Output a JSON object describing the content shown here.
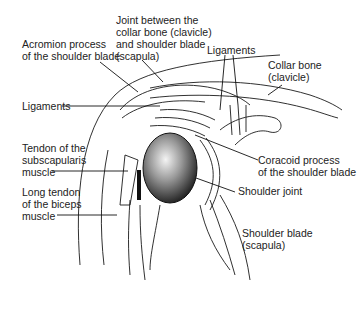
{
  "diagram": {
    "labels": [
      {
        "id": "acromion",
        "lines": [
          "Acromion process",
          "of the shoulder blade"
        ]
      },
      {
        "id": "ac-joint",
        "lines": [
          "Joint between the",
          "collar bone (clavicle)",
          "and shoulder blade",
          "(scapula)"
        ]
      },
      {
        "id": "ligaments-top",
        "lines": [
          "Ligaments"
        ]
      },
      {
        "id": "collar-bone",
        "lines": [
          "Collar bone",
          "(clavicle)"
        ]
      },
      {
        "id": "ligaments-left",
        "lines": [
          "Ligaments"
        ]
      },
      {
        "id": "subscapularis",
        "lines": [
          "Tendon of the",
          "subscapularis",
          "muscle"
        ]
      },
      {
        "id": "coracoid",
        "lines": [
          "Coracoid process",
          "of the shoulder blade"
        ]
      },
      {
        "id": "shoulder-joint",
        "lines": [
          "Shoulder joint"
        ]
      },
      {
        "id": "biceps",
        "lines": [
          "Long tendon",
          "of the biceps",
          "muscle"
        ]
      },
      {
        "id": "scapula",
        "lines": [
          "Shoulder blade",
          "(scapula)"
        ]
      }
    ],
    "colors": {
      "line": "#1a1a1a",
      "text": "#222222",
      "background": "#ffffff"
    }
  }
}
